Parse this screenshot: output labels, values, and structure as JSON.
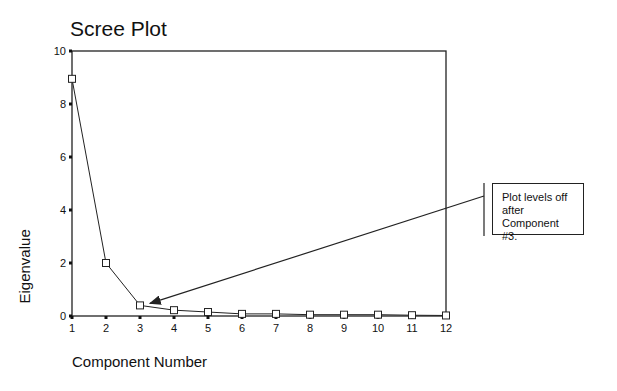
{
  "chart_data": {
    "type": "line",
    "title": "Scree Plot",
    "xlabel": "Component Number",
    "ylabel": "Eigenvalue",
    "x": [
      1,
      2,
      3,
      4,
      5,
      6,
      7,
      8,
      9,
      10,
      11,
      12
    ],
    "values": [
      8.95,
      2.0,
      0.4,
      0.22,
      0.15,
      0.08,
      0.08,
      0.05,
      0.05,
      0.05,
      0.03,
      0.02
    ],
    "xticks": [
      "1",
      "2",
      "3",
      "4",
      "5",
      "6",
      "7",
      "8",
      "9",
      "10",
      "11",
      "12"
    ],
    "yticks": [
      "0",
      "2",
      "4",
      "6",
      "8",
      "10"
    ],
    "ylim": [
      0,
      10
    ],
    "xlim": [
      1,
      12
    ],
    "grid": false,
    "marker": "open-square",
    "annotations": [
      {
        "text": "Plot levels off after Component #3.",
        "points_to": {
          "x": 3,
          "y": 0.4
        }
      }
    ]
  },
  "callout": {
    "line1": "Plot levels off",
    "line2": "after Component",
    "line3": "#3."
  }
}
